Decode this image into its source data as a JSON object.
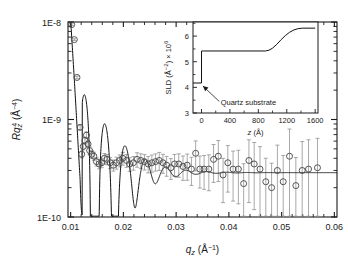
{
  "figure": {
    "background": "#ffffff",
    "foreground": "#1a1a1a",
    "marker_color": "#4d4d4d",
    "errorbar_color": "#8c8c8c",
    "curve_color": "#111111"
  },
  "main_axes": {
    "xlabel_base": "q",
    "xlabel_sub": "z",
    "xlabel_units": " (Å",
    "xlabel_exp": "−1",
    "xlabel_close": ")",
    "ylabel_base": "Rq",
    "ylabel_sub": "z",
    "ylabel_sup": "4",
    "ylabel_units": " (Å",
    "ylabel_exp": "−4",
    "ylabel_close": ")",
    "xticks": [
      "0.01",
      "0.02",
      "0.03",
      "0.04",
      "0.05",
      "0.06"
    ],
    "xtick_values": [
      0.01,
      0.02,
      0.03,
      0.04,
      0.05,
      0.06
    ],
    "yticks": [
      "1E-8",
      "1E-9",
      "1E-10"
    ],
    "ytick_values": [
      1e-08,
      1e-09,
      1e-10
    ],
    "xlim": [
      0.0095,
      0.0605
    ],
    "ylim": [
      1e-10,
      1e-08
    ],
    "yscale": "log"
  },
  "inset_axes": {
    "ylabel_base": "SLD (Å",
    "ylabel_exp": "−2",
    "ylabel_mid": ") × 10",
    "ylabel_sup": "6",
    "xlabel_base": "z",
    "xlabel_units": " (Å)",
    "xticks": [
      "0",
      "400",
      "800",
      "1200",
      "1600"
    ],
    "xtick_values": [
      0,
      400,
      800,
      1200,
      1600
    ],
    "yticks": [
      "3",
      "4",
      "5",
      "6"
    ],
    "ytick_values": [
      3,
      4,
      5,
      6
    ],
    "xlim": [
      -120,
      1640
    ],
    "ylim": [
      3.0,
      6.55
    ],
    "annotation": "Quartz substrate"
  },
  "chart_data": {
    "type": "scatter",
    "title": "",
    "xlabel": "q_z (Å^-1)",
    "ylabel": "R q_z^4 (Å^-4)",
    "xlim": [
      0.0095,
      0.0605
    ],
    "ylim": [
      1e-10,
      1e-08
    ],
    "yscale": "log",
    "grid": false,
    "legend": null,
    "series": [
      {
        "name": "measured reflectivity",
        "type": "scatter",
        "marker": "open-circle",
        "x": [
          0.0102,
          0.0107,
          0.0112,
          0.0118,
          0.0121,
          0.0124,
          0.0127,
          0.013,
          0.0133,
          0.0136,
          0.014,
          0.0144,
          0.0149,
          0.0154,
          0.0159,
          0.0164,
          0.0169,
          0.0175,
          0.0181,
          0.0187,
          0.0193,
          0.0199,
          0.0206,
          0.0212,
          0.0219,
          0.0226,
          0.0233,
          0.024,
          0.0247,
          0.0254,
          0.0261,
          0.0268,
          0.0275,
          0.0282,
          0.029,
          0.0297,
          0.0305,
          0.0313,
          0.0321,
          0.0329,
          0.0337,
          0.0345,
          0.0353,
          0.0362,
          0.0371,
          0.038,
          0.0389,
          0.0398,
          0.0408,
          0.0418,
          0.0428,
          0.0438,
          0.0448,
          0.0459,
          0.047,
          0.0481,
          0.0492,
          0.0503,
          0.0515,
          0.0527,
          0.0539,
          0.0551,
          0.0568
        ],
        "y": [
          9.4e-09,
          6.6e-09,
          2.7e-09,
          8.3e-10,
          4.4e-10,
          5.3e-10,
          6.1e-10,
          6.9e-10,
          5.6e-10,
          4.8e-10,
          4.4e-10,
          4.2e-10,
          3.7e-10,
          3.5e-10,
          3.6e-10,
          4e-10,
          3.9e-10,
          3.6e-10,
          3.4e-10,
          3.6e-10,
          3.8e-10,
          4e-10,
          3.8e-10,
          3.5e-10,
          3.6e-10,
          3.9e-10,
          3.8e-10,
          3.7e-10,
          3.5e-10,
          3.6e-10,
          3.7e-10,
          3.8e-10,
          3.6e-10,
          3.4e-10,
          3.2e-10,
          3.5e-10,
          3.5e-10,
          3.3e-10,
          3.4e-10,
          3.1e-10,
          4.5e-10,
          3.1e-10,
          3.1e-10,
          3.1e-10,
          3.9e-10,
          4.2e-10,
          2.7e-10,
          3.6e-10,
          3.1e-10,
          3.1e-10,
          2.2e-10,
          3.8e-10,
          3.5e-10,
          3.1e-10,
          2.3e-10,
          2e-10,
          3e-10,
          2.3e-10,
          4.2e-10,
          2.1e-10,
          3e-10,
          3.1e-10,
          3.2e-10
        ],
        "yerr_rel": [
          0.02,
          0.02,
          0.03,
          0.05,
          0.08,
          0.08,
          0.08,
          0.08,
          0.08,
          0.09,
          0.09,
          0.1,
          0.1,
          0.11,
          0.11,
          0.12,
          0.12,
          0.13,
          0.13,
          0.14,
          0.14,
          0.15,
          0.15,
          0.16,
          0.16,
          0.17,
          0.17,
          0.18,
          0.19,
          0.2,
          0.2,
          0.21,
          0.22,
          0.23,
          0.24,
          0.25,
          0.27,
          0.28,
          0.3,
          0.32,
          0.34,
          0.36,
          0.38,
          0.4,
          0.42,
          0.45,
          0.48,
          0.5,
          0.53,
          0.56,
          0.6,
          0.63,
          0.66,
          0.7,
          0.74,
          0.78,
          0.82,
          0.86,
          0.9,
          0.94,
          0.98,
          1.0,
          1.0
        ]
      },
      {
        "name": "model fit",
        "type": "line",
        "description": "damped oscillatory fit from multilayer SLD profile"
      }
    ]
  },
  "inset_chart_data": {
    "type": "line",
    "xlabel": "z (Å)",
    "ylabel": "SLD (Å^-2) x 10^6",
    "xlim": [
      -120,
      1640
    ],
    "ylim": [
      3.0,
      6.55
    ],
    "grid": false,
    "annotations": [
      {
        "text": "Quartz substrate",
        "points_to_x": 10,
        "points_to_y": 4.1
      }
    ],
    "series": [
      {
        "name": "SLD profile",
        "x": [
          -120,
          0,
          0,
          30,
          900,
          950,
          1000,
          1060,
          1120,
          1180,
          1240,
          1300,
          1360,
          1420,
          1600
        ],
        "y": [
          4.17,
          4.17,
          5.42,
          5.42,
          5.42,
          5.45,
          5.53,
          5.68,
          5.86,
          6.02,
          6.15,
          6.24,
          6.29,
          6.31,
          6.31
        ]
      }
    ]
  }
}
